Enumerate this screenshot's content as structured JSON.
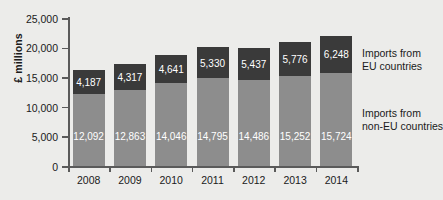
{
  "chart_data": {
    "type": "bar",
    "stacked": true,
    "title": "",
    "xlabel": "",
    "ylabel": "£ millions",
    "ylim": [
      0,
      25000
    ],
    "ytick_values": [
      0,
      5000,
      10000,
      15000,
      20000,
      25000
    ],
    "ytick_labels": [
      "0",
      "5,000",
      "10,000",
      "15,000",
      "20,000",
      "25,000"
    ],
    "grid": false,
    "legend_position": "right",
    "categories": [
      "2008",
      "2009",
      "2010",
      "2011",
      "2012",
      "2013",
      "2014"
    ],
    "series": [
      {
        "name": "Imports from non-EU countries",
        "color": "#8d8d8d",
        "values": [
          12092,
          12863,
          14046,
          14795,
          14486,
          15252,
          15724
        ],
        "labels": [
          "12,092",
          "12,863",
          "14,046",
          "14,795",
          "14,486",
          "15,252",
          "15,724"
        ]
      },
      {
        "name": "Imports from EU countries",
        "color": "#3a3a3a",
        "values": [
          4187,
          4317,
          4641,
          5330,
          5437,
          5776,
          6248
        ],
        "labels": [
          "4,187",
          "4,317",
          "4,641",
          "5,330",
          "5,437",
          "5,776",
          "6,248"
        ]
      }
    ],
    "totals": [
      16279,
      17180,
      18687,
      20125,
      19923,
      21028,
      21972
    ]
  },
  "legend": {
    "eu_line1": "Imports from",
    "eu_line2": "EU countries",
    "noneu_line1": "Imports from",
    "noneu_line2": "non-EU countries"
  },
  "colors": {
    "background": "#ececea",
    "axis": "#5a5a5a",
    "text": "#1a1a1a",
    "series_eu": "#3a3a3a",
    "series_non_eu": "#8d8d8d",
    "value_label": "#ffffff"
  }
}
